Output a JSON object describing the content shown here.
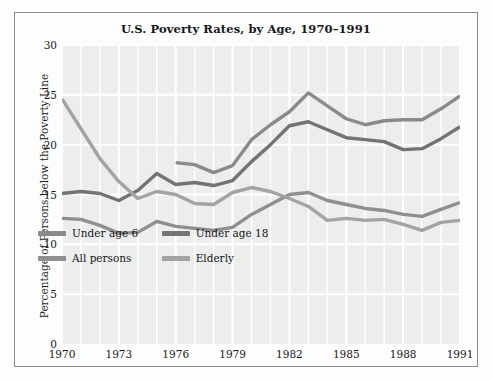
{
  "chart_data": {
    "type": "line",
    "title": "U.S. Poverty Rates, by Age, 1970–1991",
    "xlabel": "",
    "ylabel": "Percentage of Persons below the Poverty Line",
    "xlim": [
      1970,
      1991
    ],
    "ylim": [
      0,
      30
    ],
    "yticks": [
      0,
      5,
      10,
      15,
      20,
      25,
      30
    ],
    "xticks": [
      1970,
      1973,
      1976,
      1979,
      1982,
      1985,
      1988,
      1991
    ],
    "xtick_labels": [
      "1970",
      "1973",
      "1976",
      "1979",
      "1982",
      "1985",
      "1988",
      "1991"
    ],
    "ytick_labels": [
      "0",
      "5",
      "10",
      "15",
      "20",
      "25",
      "30"
    ],
    "grid": true,
    "grid_color": "#ffffff",
    "plot_background": "#eceded",
    "legend_position": "lower-left-inside",
    "x": [
      1970,
      1971,
      1972,
      1973,
      1974,
      1975,
      1976,
      1977,
      1978,
      1979,
      1980,
      1981,
      1982,
      1983,
      1984,
      1985,
      1986,
      1987,
      1988,
      1989,
      1990,
      1991
    ],
    "series": [
      {
        "name": "Under age 6",
        "color": "#8a8a8a",
        "x": [
          1976,
          1977,
          1978,
          1979,
          1980,
          1981,
          1982,
          1983,
          1984,
          1985,
          1986,
          1987,
          1988,
          1989,
          1990,
          1991
        ],
        "values": [
          18.2,
          18.0,
          17.2,
          17.9,
          20.5,
          22.0,
          23.3,
          25.2,
          23.9,
          22.6,
          22.0,
          22.4,
          22.5,
          22.5,
          23.6,
          24.9
        ]
      },
      {
        "name": "Under age 18",
        "color": "#737373",
        "x": [
          1970,
          1971,
          1972,
          1973,
          1974,
          1975,
          1976,
          1977,
          1978,
          1979,
          1980,
          1981,
          1982,
          1983,
          1984,
          1985,
          1986,
          1987,
          1988,
          1989,
          1990,
          1991
        ],
        "values": [
          15.1,
          15.3,
          15.1,
          14.4,
          15.4,
          17.1,
          16.0,
          16.2,
          15.9,
          16.4,
          18.3,
          20.0,
          21.9,
          22.3,
          21.5,
          20.7,
          20.5,
          20.3,
          19.5,
          19.6,
          20.6,
          21.8
        ]
      },
      {
        "name": "All persons",
        "color": "#8f8f8f",
        "x": [
          1970,
          1971,
          1972,
          1973,
          1974,
          1975,
          1976,
          1977,
          1978,
          1979,
          1980,
          1981,
          1982,
          1983,
          1984,
          1985,
          1986,
          1987,
          1988,
          1989,
          1990,
          1991
        ],
        "values": [
          12.6,
          12.5,
          11.9,
          11.1,
          11.2,
          12.3,
          11.8,
          11.6,
          11.4,
          11.7,
          13.0,
          14.0,
          15.0,
          15.2,
          14.4,
          14.0,
          13.6,
          13.4,
          13.0,
          12.8,
          13.5,
          14.2
        ]
      },
      {
        "name": "Elderly",
        "color": "#a3a3a3",
        "x": [
          1970,
          1971,
          1972,
          1973,
          1974,
          1975,
          1976,
          1977,
          1978,
          1979,
          1980,
          1981,
          1982,
          1983,
          1984,
          1985,
          1986,
          1987,
          1988,
          1989,
          1990,
          1991
        ],
        "values": [
          24.6,
          21.6,
          18.6,
          16.3,
          14.6,
          15.3,
          15.0,
          14.1,
          14.0,
          15.2,
          15.7,
          15.3,
          14.6,
          13.8,
          12.4,
          12.6,
          12.4,
          12.5,
          12.0,
          11.4,
          12.2,
          12.4
        ]
      }
    ]
  },
  "legend": {
    "items": [
      {
        "label": "Under age 6"
      },
      {
        "label": "Under age 18"
      },
      {
        "label": "All persons"
      },
      {
        "label": "Elderly"
      }
    ]
  }
}
